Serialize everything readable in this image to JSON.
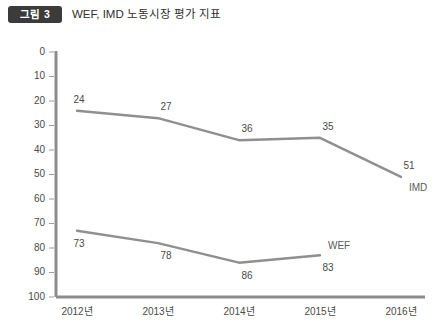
{
  "header": {
    "badge": "그림 3",
    "title": "WEF, IMD 노동시장 평가 지표"
  },
  "chart_data": {
    "type": "line",
    "title": "WEF, IMD 노동시장 평가 지표",
    "xlabel": "",
    "ylabel": "",
    "categories": [
      "2012년",
      "2013년",
      "2014년",
      "2015년",
      "2016년"
    ],
    "ylim": [
      0,
      100
    ],
    "y_inverted": true,
    "yticks": [
      0,
      10,
      20,
      30,
      40,
      50,
      60,
      70,
      80,
      90,
      100
    ],
    "ytick_labels": [
      "0",
      "10",
      "20",
      "30",
      "40",
      "50",
      "60",
      "70",
      "80",
      "90",
      "100"
    ],
    "grid": false,
    "legend": "inline-end-labels",
    "line_color": "#8f8f8f",
    "axis_color": "#8c8c8c",
    "series": [
      {
        "name": "IMD",
        "label": "IMD",
        "values": [
          24,
          27,
          36,
          35,
          51
        ],
        "point_labels": [
          "24",
          "27",
          "36",
          "35",
          "51"
        ]
      },
      {
        "name": "WEF",
        "label": "WEF",
        "values": [
          73,
          78,
          86,
          83,
          null
        ],
        "point_labels": [
          "73",
          "78",
          "86",
          "83"
        ]
      }
    ]
  }
}
